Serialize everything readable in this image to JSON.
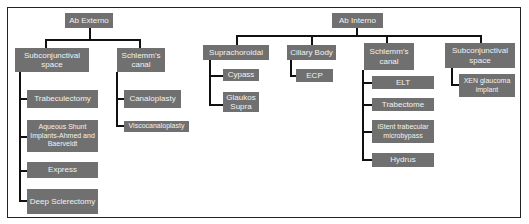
{
  "diagram": {
    "colors": {
      "node_fill": "#707070",
      "node_text": "#f2f2f2",
      "connector": "#111111",
      "frame": "#222222"
    },
    "ab_externo": {
      "label": "Ab Externo",
      "subconjunctival": {
        "label": "Subconjunctival space",
        "children": [
          "Trabeculectomy",
          "Aqueous Shunt Implants-Ahmed and Baerveldt",
          "Express",
          "Deep Sclerectomy"
        ]
      },
      "schlemms": {
        "label": "Schlemm's canal",
        "children": [
          "Canaloplasty",
          "Viscocanaloplasty"
        ]
      }
    },
    "ab_interno": {
      "label": "Ab Interno",
      "suprachoroidal": {
        "label": "Suprachoroidal",
        "children": [
          "Cypass",
          "Glaukos Supra"
        ]
      },
      "ciliary": {
        "label": "Ciliary Body",
        "children": [
          "ECP"
        ]
      },
      "schlemms": {
        "label": "Schlemm's canal",
        "children": [
          "ELT",
          "Trabectome",
          "iStent trabecular microbypass",
          "Hydrus"
        ]
      },
      "subconjunctival": {
        "label": "Subconjunctival space",
        "children": [
          "XEN glaucoma implant"
        ]
      }
    }
  }
}
